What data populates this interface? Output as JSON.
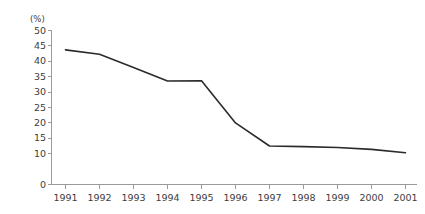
{
  "chart_data": {
    "type": "line",
    "title": "",
    "subtitle": "",
    "xlabel": "",
    "ylabel": "",
    "unit_label": "(%)",
    "categories": [
      "1991",
      "1992",
      "1993",
      "1994",
      "1995",
      "1996",
      "1997",
      "1998",
      "1999",
      "2000",
      "2001"
    ],
    "x": [
      1991,
      1992,
      1993,
      1994,
      1995,
      1996,
      1997,
      1998,
      1999,
      2000,
      2001
    ],
    "values": [
      43.7,
      42.3,
      38.0,
      33.6,
      33.7,
      20.0,
      12.5,
      12.3,
      12.0,
      11.4,
      10.3
    ],
    "series": [
      {
        "name": "",
        "values": [
          43.7,
          42.3,
          38.0,
          33.6,
          33.7,
          20.0,
          12.5,
          12.3,
          12.0,
          11.4,
          10.3
        ],
        "color": "#2b2b2b"
      }
    ],
    "ylim": [
      0,
      50
    ],
    "ytick_labels": [
      "0",
      "10",
      "15",
      "20",
      "25",
      "30",
      "35",
      "40",
      "45",
      "50"
    ],
    "yticks": [
      0,
      10,
      15,
      20,
      25,
      30,
      35,
      40,
      45,
      50
    ],
    "ytick_step": 5,
    "grid": false,
    "legend": false,
    "legend_position": "none",
    "markers": false,
    "line_color": "#2b2b2b",
    "axis_color": "#9a9a9a",
    "text_color": "#3d3d3d",
    "background": "#ffffff"
  }
}
